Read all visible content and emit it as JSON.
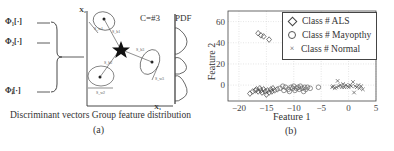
{
  "panel_a": {
    "caption": "Discriminant vectors Group feature distribution",
    "sublabel": "(a)",
    "phi_labels": [
      "Φ₁[·]",
      "Φ₂[·]",
      "Φⱼ[·]"
    ],
    "axis_x_label": "X₁",
    "axis_y_label": "X₂",
    "class_count_label": "C=#3",
    "pdf_label": "PDF",
    "mean_labels": [
      "μ₁",
      "μ₂",
      "μ₃"
    ],
    "overall_mean_label": "μ",
    "within_spread_labels": [
      "S_w1",
      "S_w2",
      "S_w3"
    ],
    "between_labels": [
      "S_b1",
      "S_b2",
      "S_b3"
    ]
  },
  "panel_b": {
    "sublabel": "(b)",
    "xlabel": "Feature 1",
    "ylabel": "Feature 2",
    "legend": [
      {
        "marker": "diamond",
        "label": "Class # ALS"
      },
      {
        "marker": "circle",
        "label": "Class # Mayopthy"
      },
      {
        "marker": "x",
        "label": "Class # Normal"
      }
    ]
  },
  "chart_data": {
    "type": "scatter",
    "title": "",
    "xlabel": "Feature 1",
    "ylabel": "Feature 2",
    "xlim": [
      -22,
      5
    ],
    "ylim": [
      -15,
      70
    ],
    "xticks": [
      -20,
      -15,
      -10,
      -5,
      0,
      5
    ],
    "yticks": [
      0,
      20,
      40,
      60
    ],
    "grid": true,
    "legend_position": "upper right",
    "series": [
      {
        "name": "Class # ALS",
        "marker": "diamond",
        "points": [
          [
            -16.5,
            49
          ],
          [
            -16,
            47
          ],
          [
            -15.5,
            46
          ],
          [
            -14.5,
            43
          ],
          [
            -18,
            -8
          ],
          [
            -17.5,
            -6
          ],
          [
            -17,
            -5
          ],
          [
            -16.8,
            -4
          ],
          [
            -16.5,
            -6
          ],
          [
            -16.2,
            -3
          ],
          [
            -16,
            -5
          ],
          [
            -15.8,
            -7
          ],
          [
            -15.5,
            -4
          ],
          [
            -15.2,
            -6
          ],
          [
            -15,
            -9
          ],
          [
            -14.8,
            -5
          ],
          [
            -14.5,
            -7
          ],
          [
            -14.2,
            -4
          ],
          [
            -14,
            -6
          ],
          [
            -13.8,
            -3
          ],
          [
            -13.5,
            -5
          ],
          [
            -13,
            -4
          ]
        ]
      },
      {
        "name": "Class # Mayopthy",
        "marker": "circle",
        "points": [
          [
            -12.5,
            -3
          ],
          [
            -12,
            -1
          ],
          [
            -11.8,
            -5
          ],
          [
            -11.5,
            -2
          ],
          [
            -11,
            -4
          ],
          [
            -10.8,
            -6
          ],
          [
            -10.5,
            -2
          ],
          [
            -10.2,
            -3
          ],
          [
            -10,
            -1
          ],
          [
            -9.8,
            -5
          ],
          [
            -9.5,
            -3
          ],
          [
            -9.2,
            -2
          ],
          [
            -9,
            -4
          ],
          [
            -8.8,
            -1
          ],
          [
            -8.5,
            -3
          ],
          [
            -8.2,
            -6
          ],
          [
            -8,
            -2
          ],
          [
            -7.8,
            -4
          ],
          [
            -7.5,
            -2
          ],
          [
            -7,
            -3
          ],
          [
            -5.5,
            -2
          ]
        ]
      },
      {
        "name": "Class # Normal",
        "marker": "x",
        "points": [
          [
            -3,
            -2
          ],
          [
            -2.8,
            -1
          ],
          [
            -2.5,
            -3
          ],
          [
            -2.2,
            -2
          ],
          [
            -2,
            4
          ],
          [
            -1.8,
            -1
          ],
          [
            -1.5,
            0
          ],
          [
            -1.2,
            -2
          ],
          [
            -1,
            1
          ],
          [
            -0.8,
            -2
          ],
          [
            -0.5,
            0
          ],
          [
            -0.2,
            -1
          ],
          [
            0,
            -2
          ],
          [
            0.3,
            0
          ],
          [
            0.5,
            -1
          ],
          [
            0.8,
            3
          ],
          [
            1,
            -7
          ],
          [
            1.2,
            -1
          ],
          [
            1.5,
            -2
          ],
          [
            1.8,
            0
          ],
          [
            2,
            -3
          ],
          [
            2.3,
            -1
          ],
          [
            2.6,
            -4
          ]
        ]
      }
    ]
  }
}
